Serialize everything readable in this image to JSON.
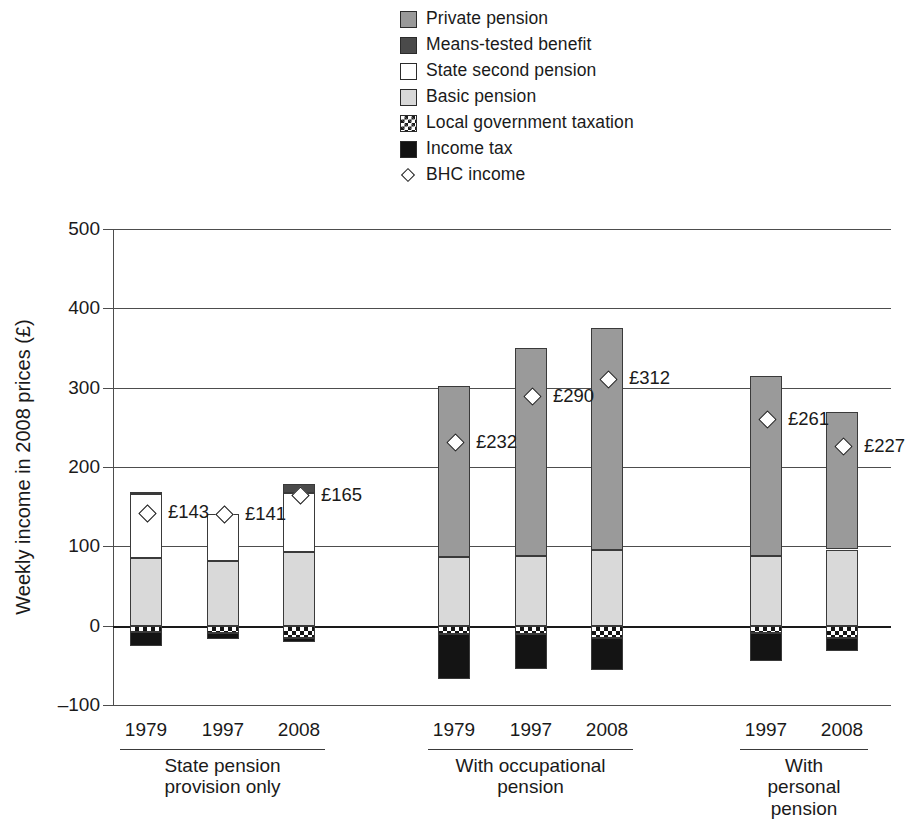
{
  "chart_data": {
    "type": "bar",
    "title": "",
    "xlabel": "",
    "ylabel": "Weekly income in 2008 prices (£)",
    "ylim": [
      -100,
      500
    ],
    "yticks": [
      500,
      400,
      300,
      200,
      100,
      0,
      -100
    ],
    "grid": true,
    "stacked": true,
    "legend_position": "top-center",
    "legend": [
      {
        "key": "private",
        "label": "Private pension",
        "swatch": "medium-gray"
      },
      {
        "key": "means",
        "label": "Means-tested benefit",
        "swatch": "dark-gray"
      },
      {
        "key": "state2",
        "label": "State second pension",
        "swatch": "white"
      },
      {
        "key": "basic",
        "label": "Basic pension",
        "swatch": "light-gray"
      },
      {
        "key": "localtax",
        "label": "Local government taxation",
        "swatch": "checkerboard"
      },
      {
        "key": "incometax",
        "label": "Income tax",
        "swatch": "black"
      },
      {
        "key": "bhc",
        "label": "BHC income",
        "swatch": "diamond-marker"
      }
    ],
    "groups": [
      {
        "name": "State pension\nprovision only",
        "categories": [
          "1979",
          "1997",
          "2008"
        ]
      },
      {
        "name": "With occupational\npension",
        "categories": [
          "1979",
          "1997",
          "2008"
        ]
      },
      {
        "name": "With personal\npension",
        "categories": [
          "1997",
          "2008"
        ]
      }
    ],
    "series": [
      {
        "name": "Basic pension",
        "values": [
          85,
          82,
          93,
          87,
          88,
          95,
          88,
          96
        ]
      },
      {
        "name": "State second pension",
        "values": [
          81,
          59,
          74,
          0,
          0,
          0,
          0,
          0
        ]
      },
      {
        "name": "Means-tested benefit",
        "values": [
          3,
          0,
          12,
          0,
          0,
          0,
          0,
          0
        ]
      },
      {
        "name": "Private pension",
        "values": [
          0,
          0,
          0,
          215,
          262,
          280,
          227,
          173
        ]
      },
      {
        "name": "Local government taxation",
        "values": [
          -8,
          -9,
          -16,
          -10,
          -10,
          -16,
          -9,
          -15
        ]
      },
      {
        "name": "Income tax",
        "values": [
          -18,
          -8,
          -4,
          -57,
          -44,
          -40,
          -35,
          -17
        ]
      }
    ],
    "markers": {
      "name": "BHC income",
      "values": [
        143,
        141,
        165,
        232,
        290,
        312,
        261,
        227
      ],
      "labels": [
        "£143",
        "£141",
        "£165",
        "£232",
        "£290",
        "£312",
        "£261",
        "£227"
      ]
    },
    "colors": {
      "private": "#9a9a9a",
      "means": "#4a4a4a",
      "state2": "#ffffff",
      "basic": "#d9d9d9",
      "localtax": "#141414",
      "incometax": "#141414",
      "axis": "#4d4d4d",
      "text": "#1a1a1a"
    }
  }
}
